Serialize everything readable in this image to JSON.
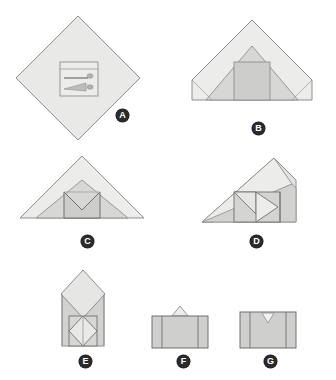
{
  "figure": {
    "background_color": "#ffffff",
    "panel_count": 7
  },
  "palette": {
    "paper_light": "#e9e9e7",
    "paper_mid": "#d9d9d7",
    "paper_dark": "#c9c9c7",
    "paper_darker": "#bdbdbb",
    "stroke": "#8e8e8c",
    "stroke_dark": "#6f6f6d",
    "badge_fill": "#2b2b2b",
    "badge_text": "#ffffff",
    "detail_line": "#9a9a98"
  },
  "panels": [
    {
      "id": "a",
      "label": "A",
      "caption": "Square sheet rotated to a diamond with printed detail panel at center",
      "shape": "diamond",
      "badge_x": 116,
      "badge_y": 109
    },
    {
      "id": "b",
      "label": "B",
      "caption": "Top and bottom corners folded in forming a wide triangle with center square",
      "shape": "triangle-with-square",
      "badge_x": 252,
      "badge_y": 122
    },
    {
      "id": "c",
      "label": "C",
      "caption": "Center square top edge folded down into a V notch",
      "shape": "triangle-with-notch",
      "badge_x": 81,
      "badge_y": 235
    },
    {
      "id": "d",
      "label": "D",
      "caption": "Left side folded over diagonally, right flap forms an arrow",
      "shape": "diagonal-fold",
      "badge_x": 250,
      "badge_y": 235
    },
    {
      "id": "e",
      "label": "E",
      "caption": "Side flaps folded in, diamond top with inner diamond base",
      "shape": "house-with-diamond",
      "badge_x": 79,
      "badge_y": 355
    },
    {
      "id": "f",
      "label": "F",
      "caption": "Top point folded down leaving small peak above rectangle",
      "shape": "rectangle-with-peak",
      "badge_x": 177,
      "badge_y": 355
    },
    {
      "id": "g",
      "label": "G",
      "caption": "Finished rectangle with small V notch tucked at top center",
      "shape": "rectangle-with-notch",
      "badge_x": 264,
      "badge_y": 355
    }
  ]
}
